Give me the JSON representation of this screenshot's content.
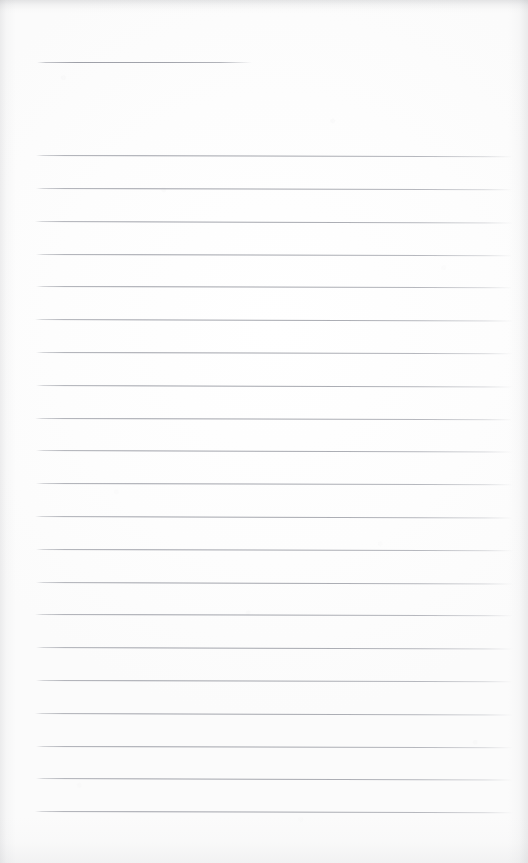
{
  "document": {
    "kind": "scanned-ruled-notepaper",
    "title": "Blank lined paper",
    "has_text_content": false,
    "transcribed_text": "",
    "page_width": 528,
    "page_height": 863,
    "paper_color": "#fdfdfd",
    "rule_color": "#a4a6ae",
    "edge_shadow_color": "#82848a"
  },
  "header_rule": {
    "name": "header-rule",
    "x": 37,
    "y": 62,
    "width": 215,
    "thickness": 1
  },
  "ruled_area": {
    "first_line_y": 155,
    "last_line_y": 811,
    "line_spacing": 32.8,
    "line_count": 21,
    "line_left_x": 36,
    "line_right_x": 513,
    "line_width": 477,
    "bottom_margin_height": 52
  },
  "rules": [
    {
      "index": 1,
      "y": 155,
      "x": 36,
      "width": 477,
      "skew": 0.16
    },
    {
      "index": 2,
      "y": 188,
      "x": 36,
      "width": 477,
      "skew": 0.16
    },
    {
      "index": 3,
      "y": 221,
      "x": 35,
      "width": 478,
      "skew": 0.18
    },
    {
      "index": 4,
      "y": 254,
      "x": 36,
      "width": 477,
      "skew": 0.14
    },
    {
      "index": 5,
      "y": 286,
      "x": 36,
      "width": 477,
      "skew": 0.16
    },
    {
      "index": 6,
      "y": 319,
      "x": 35,
      "width": 478,
      "skew": 0.18
    },
    {
      "index": 7,
      "y": 352,
      "x": 36,
      "width": 477,
      "skew": 0.15
    },
    {
      "index": 8,
      "y": 385,
      "x": 36,
      "width": 477,
      "skew": 0.17
    },
    {
      "index": 9,
      "y": 418,
      "x": 35,
      "width": 478,
      "skew": 0.16
    },
    {
      "index": 10,
      "y": 450,
      "x": 36,
      "width": 477,
      "skew": 0.18
    },
    {
      "index": 11,
      "y": 483,
      "x": 36,
      "width": 477,
      "skew": 0.15
    },
    {
      "index": 12,
      "y": 516,
      "x": 35,
      "width": 478,
      "skew": 0.17
    },
    {
      "index": 13,
      "y": 549,
      "x": 36,
      "width": 477,
      "skew": 0.16
    },
    {
      "index": 14,
      "y": 582,
      "x": 36,
      "width": 477,
      "skew": 0.18
    },
    {
      "index": 15,
      "y": 614,
      "x": 35,
      "width": 478,
      "skew": 0.15
    },
    {
      "index": 16,
      "y": 647,
      "x": 36,
      "width": 477,
      "skew": 0.17
    },
    {
      "index": 17,
      "y": 680,
      "x": 36,
      "width": 477,
      "skew": 0.16
    },
    {
      "index": 18,
      "y": 713,
      "x": 35,
      "width": 478,
      "skew": 0.18
    },
    {
      "index": 19,
      "y": 746,
      "x": 36,
      "width": 477,
      "skew": 0.15
    },
    {
      "index": 20,
      "y": 778,
      "x": 36,
      "width": 477,
      "skew": 0.17
    },
    {
      "index": 21,
      "y": 811,
      "x": 35,
      "width": 478,
      "skew": 0.16
    }
  ]
}
